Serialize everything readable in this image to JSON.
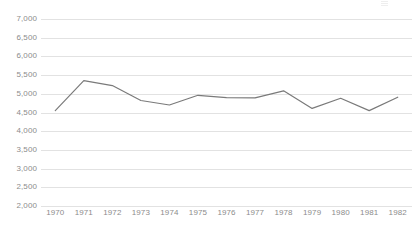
{
  "chart_data": {
    "type": "line",
    "title": "",
    "subtitle": "",
    "xlabel": "",
    "ylabel": "",
    "categories": [
      "1970",
      "1971",
      "1972",
      "1973",
      "1974",
      "1975",
      "1976",
      "1977",
      "1978",
      "1979",
      "1980",
      "1981",
      "1982"
    ],
    "values": [
      4550,
      5350,
      5220,
      4820,
      4700,
      4960,
      4900,
      4890,
      5080,
      4610,
      4880,
      4550,
      4910
    ],
    "series": [
      {
        "name": "",
        "values": [
          4550,
          5350,
          5220,
          4820,
          4700,
          4960,
          4900,
          4890,
          5080,
          4610,
          4880,
          4550,
          4910
        ]
      }
    ],
    "ylim": [
      2000,
      7000
    ],
    "y_ticks": [
      2000,
      2500,
      3000,
      3500,
      4000,
      4500,
      5000,
      5500,
      6000,
      6500,
      7000
    ],
    "y_tick_labels": [
      "2,000",
      "2,500",
      "3,000",
      "3,500",
      "4,000",
      "4,500",
      "5,000",
      "5,500",
      "6,000",
      "6,500",
      "7,000"
    ],
    "x_tick_labels": [
      "1970",
      "1971",
      "1972",
      "1973",
      "1974",
      "1975",
      "1976",
      "1977",
      "1978",
      "1979",
      "1980",
      "1981",
      "1982"
    ],
    "grid": "horizontal",
    "legend": "none",
    "line_color": "#7a7a7a",
    "grid_color": "#e2e2e2",
    "axis_text_color": "#8c8c8c",
    "background_color": "#ffffff"
  }
}
